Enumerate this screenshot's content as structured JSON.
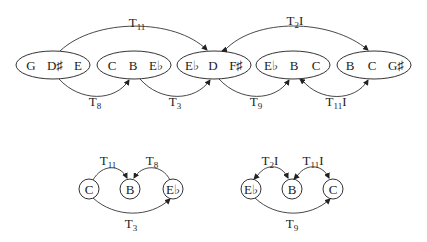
{
  "top_diagram": {
    "nodes": [
      {
        "id": "n1",
        "notes": [
          "G",
          "D♯",
          "E"
        ]
      },
      {
        "id": "n2",
        "notes": [
          "C",
          "B",
          "E♭"
        ]
      },
      {
        "id": "n3",
        "notes": [
          "E♭",
          "D",
          "F♯"
        ]
      },
      {
        "id": "n4",
        "notes": [
          "E♭",
          "B",
          "C"
        ]
      },
      {
        "id": "n5",
        "notes": [
          "B",
          "C",
          "G♯"
        ]
      }
    ],
    "edges": [
      {
        "from": "n1",
        "to": "n3",
        "label": "T",
        "sub": "11",
        "suffix": "",
        "position": "above"
      },
      {
        "from": "n3",
        "to": "n5",
        "label": "T",
        "sub": "2",
        "suffix": "I",
        "position": "above",
        "bidirectional": true
      },
      {
        "from": "n1",
        "to": "n2",
        "label": "T",
        "sub": "8",
        "suffix": "",
        "position": "below"
      },
      {
        "from": "n2",
        "to": "n3",
        "label": "T",
        "sub": "3",
        "suffix": "",
        "position": "below"
      },
      {
        "from": "n3",
        "to": "n4",
        "label": "T",
        "sub": "9",
        "suffix": "",
        "position": "below"
      },
      {
        "from": "n4",
        "to": "n5",
        "label": "T",
        "sub": "11",
        "suffix": "I",
        "position": "below",
        "bidirectional": true
      }
    ]
  },
  "bottom_left": {
    "nodes": [
      "C",
      "B",
      "E♭"
    ],
    "edges": [
      {
        "from": "C",
        "to": "B",
        "label": "T",
        "sub": "11",
        "suffix": ""
      },
      {
        "from": "E♭",
        "to": "B",
        "label": "T",
        "sub": "8",
        "suffix": ""
      },
      {
        "from": "C",
        "to": "E♭",
        "label": "T",
        "sub": "3",
        "suffix": ""
      }
    ]
  },
  "bottom_right": {
    "nodes": [
      "E♭",
      "B",
      "C"
    ],
    "edges": [
      {
        "from": "E♭",
        "to": "B",
        "label": "T",
        "sub": "2",
        "suffix": "I",
        "bidirectional": true
      },
      {
        "from": "B",
        "to": "C",
        "label": "T",
        "sub": "11",
        "suffix": "I",
        "bidirectional": true
      },
      {
        "from": "E♭",
        "to": "C",
        "label": "T",
        "sub": "9",
        "suffix": ""
      }
    ]
  }
}
